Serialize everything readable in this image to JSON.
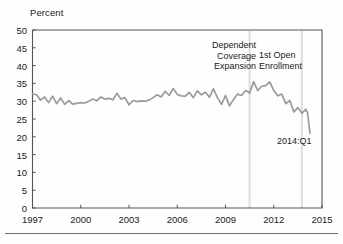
{
  "figure": {
    "axis_title": "Percent",
    "end_label": "2014:Q1",
    "line_color": "#9a9a9a",
    "axis_color": "#555555",
    "marker_line_color": "#e0e0e0",
    "text_color": "#1a1a1a"
  },
  "annotations": {
    "dependent_coverage": {
      "line1": "Dependent",
      "line2": "Coverage",
      "line3": "Expansion"
    },
    "open_enrollment": {
      "line1": "1st Open",
      "line2": "Enrollment"
    }
  },
  "chart_data": {
    "type": "line",
    "title": "",
    "subtitle": "",
    "xlabel": "",
    "ylabel": "Percent",
    "xlim": [
      1997,
      2015
    ],
    "ylim": [
      0,
      50
    ],
    "grid": false,
    "legend": false,
    "legend_position": "none",
    "xticks": [
      1997,
      2000,
      2003,
      2006,
      2009,
      2012,
      2015
    ],
    "xtick_labels": [
      "1997",
      "2000",
      "2003",
      "2006",
      "2009",
      "2012",
      "2015"
    ],
    "yticks": [
      0,
      5,
      10,
      15,
      20,
      25,
      30,
      35,
      40,
      45,
      50
    ],
    "ytick_labels": [
      "0",
      "5",
      "10",
      "15",
      "20",
      "25",
      "30",
      "35",
      "40",
      "45",
      "50"
    ],
    "vertical_markers": [
      {
        "x": 2010.5,
        "label": "Dependent Coverage Expansion"
      },
      {
        "x": 2013.75,
        "label": "1st Open Enrollment"
      }
    ],
    "annotation_texts": [
      {
        "text": "Dependent Coverage Expansion",
        "x": 2010.3,
        "y": 43
      },
      {
        "text": "1st Open Enrollment",
        "x": 2011.0,
        "y": 41
      },
      {
        "text": "2014:Q1",
        "x": 2013.9,
        "y": 22.5
      }
    ],
    "series": [
      {
        "name": "Uninsured rate",
        "color": "#9a9a9a",
        "x": [
          1997.0,
          1997.25,
          1997.5,
          1997.75,
          1998.0,
          1998.25,
          1998.5,
          1998.75,
          1999.0,
          1999.25,
          1999.5,
          1999.75,
          2000.0,
          2000.25,
          2000.5,
          2000.75,
          2001.0,
          2001.25,
          2001.5,
          2001.75,
          2002.0,
          2002.25,
          2002.5,
          2002.75,
          2003.0,
          2003.25,
          2003.5,
          2003.75,
          2004.0,
          2004.25,
          2004.5,
          2004.75,
          2005.0,
          2005.25,
          2005.5,
          2005.75,
          2006.0,
          2006.25,
          2006.5,
          2006.75,
          2007.0,
          2007.25,
          2007.5,
          2007.75,
          2008.0,
          2008.25,
          2008.5,
          2008.75,
          2009.0,
          2009.25,
          2009.5,
          2009.75,
          2010.0,
          2010.25,
          2010.5,
          2010.75,
          2011.0,
          2011.25,
          2011.5,
          2011.75,
          2012.0,
          2012.25,
          2012.5,
          2012.75,
          2013.0,
          2013.25,
          2013.5,
          2013.75,
          2014.0
        ],
        "values": [
          32.1,
          31.8,
          30.3,
          31.2,
          29.6,
          31.4,
          29.3,
          30.9,
          29.1,
          30.2,
          29.2,
          29.4,
          29.6,
          29.5,
          30.0,
          30.6,
          30.1,
          31.2,
          30.6,
          30.8,
          30.4,
          32.2,
          30.6,
          31.0,
          29.0,
          30.2,
          29.9,
          30.1,
          30.0,
          30.3,
          31.0,
          31.8,
          31.2,
          32.8,
          31.6,
          33.6,
          31.9,
          31.5,
          31.4,
          32.5,
          31.0,
          32.9,
          31.8,
          32.5,
          31.1,
          33.5,
          31.0,
          29.1,
          31.6,
          28.7,
          30.5,
          32.0,
          31.6,
          33.0,
          32.3,
          35.5,
          33.0,
          34.2,
          34.4,
          35.4,
          33.0,
          31.5,
          32.0,
          29.3,
          30.2,
          27.0,
          28.2,
          26.6,
          27.8
        ]
      }
    ],
    "tail_segment": {
      "note": "final quarters continue decline",
      "x": [
        2014.0,
        2014.1,
        2014.25
      ],
      "values": [
        27.3,
        26.9,
        21.0
      ]
    },
    "data_note": "Quarterly series, 1997:Q1 through 2014:Q1, percent"
  }
}
